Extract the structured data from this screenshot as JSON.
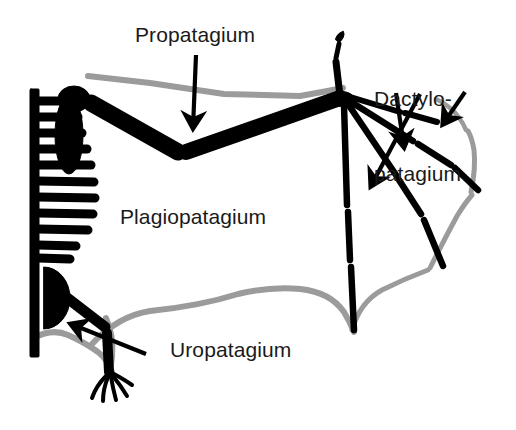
{
  "figure": {
    "name": "bat-wing-membrane-anatomy-diagram",
    "background_color": "#ffffff",
    "bone_color": "#000000",
    "membrane_color": "#9b9b9b",
    "text_color": "#1a1a1a",
    "width": 516,
    "height": 430
  },
  "labels": {
    "propatagium": "Propatagium",
    "dactylopatagium_line1": "Dactylo-",
    "dactylopatagium_line2": "patagium",
    "plagiopatagium": "Plagiopatagium",
    "uropatagium": "Uropatagium"
  },
  "annotations": {
    "arrows": [
      {
        "name": "arrow-propatagium",
        "from": [
          196,
          55
        ],
        "to": [
          193,
          133
        ],
        "points_to": "propatagium"
      },
      {
        "name": "arrow-dactylopatagium-1",
        "from": [
          420,
          94
        ],
        "to": [
          368,
          192
        ],
        "points_to": "dactylopatagium"
      },
      {
        "name": "arrow-dactylopatagium-2",
        "from": [
          396,
          93
        ],
        "to": [
          404,
          153
        ],
        "points_to": "dactylopatagium"
      },
      {
        "name": "arrow-dactylopatagium-3",
        "from": [
          465,
          92
        ],
        "to": [
          441,
          129
        ],
        "points_to": "dactylopatagium"
      },
      {
        "name": "arrow-uropatagium",
        "from": [
          146,
          354
        ],
        "to": [
          66,
          322
        ],
        "points_to": "uropatagium"
      }
    ]
  },
  "skeleton": {
    "parts": [
      "vertebral-column",
      "ribs",
      "scapula",
      "humerus",
      "radius-ulna",
      "wrist",
      "digit-1-thumb",
      "digit-2",
      "digit-3",
      "digit-4",
      "digit-5",
      "pelvis",
      "femur",
      "tibia",
      "foot-toes"
    ],
    "rib_count": 11
  },
  "membranes": {
    "names": [
      "propatagium",
      "plagiopatagium",
      "dactylopatagium",
      "uropatagium"
    ]
  }
}
